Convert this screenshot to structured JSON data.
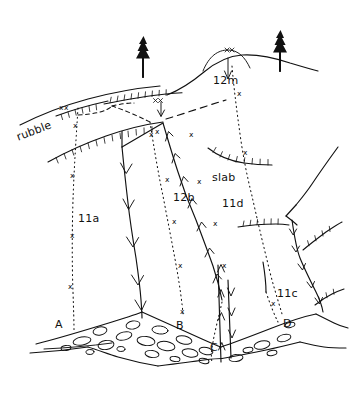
{
  "figure": {
    "background_color": "#ffffff",
    "ink_color": "#111111"
  },
  "labels": {
    "rubble": "rubble",
    "slab": "slab",
    "unit_11a": "11a",
    "unit_11c": "11c",
    "unit_11d": "11d",
    "unit_12b": "12b",
    "unit_12m": "12m",
    "point_a": "A",
    "point_b": "B",
    "point_c": "C",
    "point_d": "D"
  },
  "x_marks": {
    "symbol": "x",
    "count": 22,
    "meaning": "sample / crossing point marker along dotted traverse lines"
  },
  "symbols": {
    "tree": "conifer-tree-icon",
    "tree_count": 2,
    "scarp": "hachured-scarp-line",
    "channel_arrow": "downslope-chevron-arrow",
    "boulders": "cobble-outline",
    "boulder_count": 23
  },
  "legend_note": {
    "dotted_lines": "traverse / profile lines A, B, C, D",
    "hachured_lines": "scarps and terrace risers",
    "chevron_lines": "gullies and channels with flow direction"
  }
}
